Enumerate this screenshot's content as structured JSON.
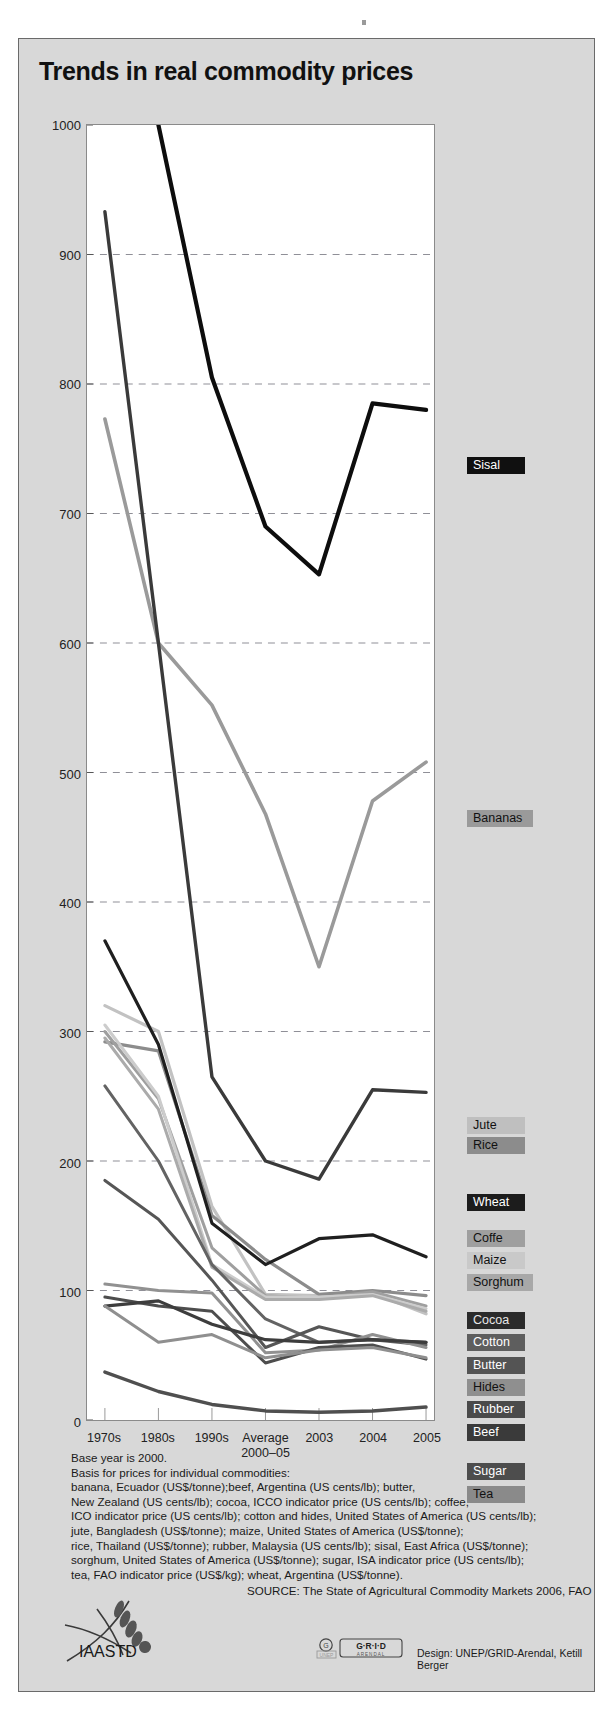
{
  "title": "Trends in real commodity prices",
  "axes": {
    "y_ticks": [
      0,
      100,
      200,
      300,
      400,
      500,
      600,
      700,
      800,
      900,
      1000
    ],
    "y_min": 0,
    "y_max": 1000,
    "x_categories": [
      "1970s",
      "1980s",
      "1990s",
      "Average\n2000–05",
      "2003",
      "2004",
      "2005"
    ]
  },
  "legend": [
    {
      "name": "Sisal",
      "label": "Sisal",
      "bg": "#101010",
      "fg": "#ffffff",
      "y": 418
    },
    {
      "name": "Bananas",
      "label": "Bananas",
      "bg": "#9a9a9a",
      "fg": "#111111",
      "y": 771
    },
    {
      "name": "Jute",
      "label": "Jute",
      "bg": "#bfbfbf",
      "fg": "#111111",
      "y": 1078
    },
    {
      "name": "Rice",
      "label": "Rice",
      "bg": "#8c8c8c",
      "fg": "#111111",
      "y": 1098
    },
    {
      "name": "Wheat",
      "label": "Wheat",
      "bg": "#1c1c1c",
      "fg": "#ffffff",
      "y": 1155
    },
    {
      "name": "Coffe",
      "label": "Coffe",
      "bg": "#9f9f9f",
      "fg": "#111111",
      "y": 1191
    },
    {
      "name": "Maize",
      "label": "Maize",
      "bg": "#c9c9c9",
      "fg": "#111111",
      "y": 1213
    },
    {
      "name": "Sorghum",
      "label": "Sorghum",
      "bg": "#a8a8a8",
      "fg": "#111111",
      "y": 1235
    },
    {
      "name": "Cocoa",
      "label": "Cocoa",
      "bg": "#2b2b2b",
      "fg": "#e8e8e8",
      "y": 1273
    },
    {
      "name": "Cotton",
      "label": "Cotton",
      "bg": "#5e5e5e",
      "fg": "#ffffff",
      "y": 1295
    },
    {
      "name": "Butter",
      "label": "Butter",
      "bg": "#545454",
      "fg": "#ffffff",
      "y": 1318
    },
    {
      "name": "Hides",
      "label": "Hides",
      "bg": "#8f8f8f",
      "fg": "#111111",
      "y": 1340
    },
    {
      "name": "Rubber",
      "label": "Rubber",
      "bg": "#4a4a4a",
      "fg": "#ffffff",
      "y": 1362
    },
    {
      "name": "Beef",
      "label": "Beef",
      "bg": "#3a3a3a",
      "fg": "#ffffff",
      "y": 1385
    },
    {
      "name": "Sugar",
      "label": "Sugar",
      "bg": "#4d4d4d",
      "fg": "#ffffff",
      "y": 1424
    },
    {
      "name": "Tea",
      "label": "Tea",
      "bg": "#8a8a8a",
      "fg": "#111111",
      "y": 1447
    }
  ],
  "notes": [
    "Base year is 2000.",
    "Basis for prices for individual commodities:",
    "banana, Ecuador (US$/tonne);beef, Argentina (US cents/lb); butter,",
    "New Zealand (US cents/lb); cocoa, ICCO indicator price (US cents/lb); coffee,",
    "ICO indicator price (US cents/lb); cotton and hides, United States of America (US cents/lb);",
    "jute, Bangladesh (US$/tonne); maize, United States of America (US$/tonne);",
    "rice, Thailand (US$/tonne); rubber, Malaysia (US cents/lb); sisal, East Africa (US$/tonne);",
    "sorghum, United States of America (US$/tonne); sugar, ISA indicator price (US cents/lb);",
    "tea, FAO indicator price (US$/kg); wheat, Argentina (US$/tonne)."
  ],
  "source": "SOURCE: The State of Agricultural Commodity Markets 2006, FAO",
  "design": "Design: UNEP/GRID-Arendal, Ketill Berger",
  "iaastd_label": "IAASTD",
  "grid_logo": {
    "unep": "UNEP",
    "grid": "G·R·I·D",
    "arendal": "ARENDAL"
  },
  "chart_data": {
    "type": "line",
    "title": "Trends in real commodity prices",
    "xlabel": "",
    "ylabel": "",
    "ylim": [
      0,
      1000
    ],
    "grid": "horizontal-dashed",
    "legend_position": "right",
    "x": [
      "1970s",
      "1980s",
      "1990s",
      "Average 2000–05",
      "2003",
      "2004",
      "2005"
    ],
    "series": [
      {
        "name": "Sisal",
        "color": "#0d0d0d",
        "width": 4.2,
        "values": [
          null,
          1000,
          805,
          690,
          653,
          785,
          780
        ]
      },
      {
        "name": "Bananas",
        "color": "#9a9a9a",
        "width": 3.6,
        "values": [
          773,
          600,
          552,
          468,
          350,
          478,
          508
        ]
      },
      {
        "name": "Cocoa",
        "color": "#3a3a3a",
        "width": 3.4,
        "values": [
          933,
          600,
          265,
          200,
          186,
          255,
          253
        ]
      },
      {
        "name": "Jute",
        "color": "#c2c2c2",
        "width": 3.2,
        "values": [
          320,
          300,
          165,
          97,
          96,
          98,
          82
        ]
      },
      {
        "name": "Rice",
        "color": "#8c8c8c",
        "width": 3.2,
        "values": [
          292,
          285,
          158,
          124,
          97,
          100,
          96
        ]
      },
      {
        "name": "Wheat",
        "color": "#1f1f1f",
        "width": 3.2,
        "values": [
          370,
          290,
          152,
          120,
          140,
          143,
          126
        ]
      },
      {
        "name": "Coffe",
        "color": "#9f9f9f",
        "width": 3.0,
        "values": [
          300,
          248,
          133,
          96,
          94,
          99,
          88
        ]
      },
      {
        "name": "Maize",
        "color": "#cccccc",
        "width": 3.0,
        "values": [
          305,
          250,
          120,
          95,
          95,
          97,
          86
        ]
      },
      {
        "name": "Sorghum",
        "color": "#ababab",
        "width": 3.0,
        "values": [
          295,
          240,
          118,
          93,
          93,
          96,
          84
        ]
      },
      {
        "name": "Cotton",
        "color": "#636363",
        "width": 3.0,
        "values": [
          258,
          200,
          120,
          78,
          60,
          62,
          58
        ]
      },
      {
        "name": "Butter",
        "color": "#565656",
        "width": 3.0,
        "values": [
          185,
          155,
          108,
          56,
          72,
          62,
          60
        ]
      },
      {
        "name": "Hides",
        "color": "#919191",
        "width": 3.0,
        "values": [
          105,
          100,
          98,
          52,
          54,
          66,
          56
        ]
      },
      {
        "name": "Rubber",
        "color": "#4d4d4d",
        "width": 3.0,
        "values": [
          95,
          88,
          84,
          44,
          56,
          58,
          47
        ]
      },
      {
        "name": "Beef",
        "color": "#3d3d3d",
        "width": 3.2,
        "values": [
          88,
          92,
          74,
          62,
          60,
          62,
          60
        ]
      },
      {
        "name": "Tea",
        "color": "#8f8f8f",
        "width": 3.0,
        "values": [
          88,
          60,
          66,
          48,
          54,
          56,
          48
        ]
      },
      {
        "name": "Sugar",
        "color": "#4f4f4f",
        "width": 3.4,
        "values": [
          37,
          22,
          12,
          7,
          6,
          7,
          10
        ]
      }
    ]
  }
}
